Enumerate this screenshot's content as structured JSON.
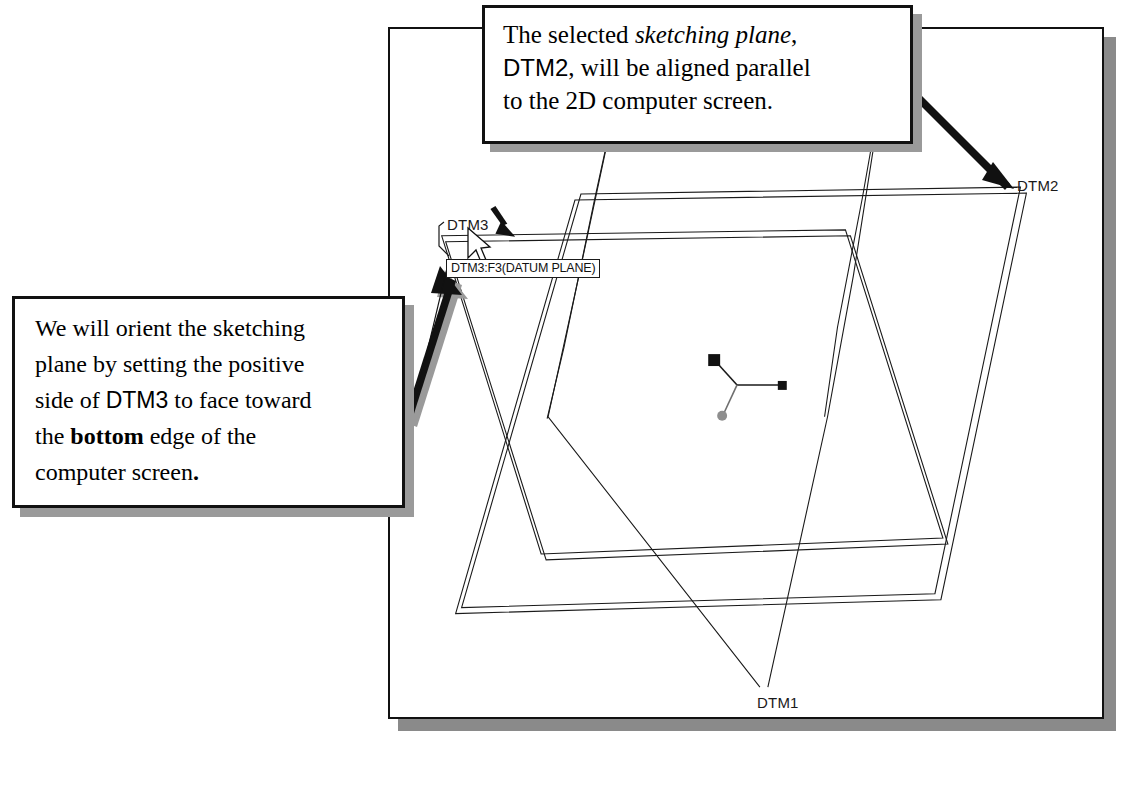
{
  "document": {
    "type": "cad-tutorial-figure",
    "background_color": "#ffffff"
  },
  "cad_window": {
    "name": "pro-engineer-graphics-window",
    "border_color": "#111111",
    "background_color": "#ffffff",
    "shadow_color": "#8a8a8a"
  },
  "model": {
    "description": "Three default datum planes shown in a 3D trimetric view with a coordinate system triad at the origin.",
    "datum_planes": [
      {
        "id": "dtm2",
        "label": "DTM2",
        "role": "sketching plane",
        "label_position": {
          "x": 1017,
          "y": 177
        }
      },
      {
        "id": "dtm3",
        "label": "DTM3",
        "role": "reference / orientation plane",
        "label_position": {
          "x": 447,
          "y": 216
        }
      },
      {
        "id": "dtm1",
        "label": "DTM1",
        "role": "datum plane",
        "label_position": {
          "x": 757,
          "y": 694
        }
      }
    ],
    "coordinate_system": {
      "name": "csys-triad",
      "axes": 3,
      "origin": {
        "x": 737,
        "y": 383
      }
    },
    "direction_arrow": {
      "name": "positive-side-arrow",
      "meaning": "positive side of DTM3",
      "points": "down-right"
    }
  },
  "tooltip": {
    "text": "DTM3:F3(DATUM PLANE)",
    "border_color": "#1a1a1a",
    "background_color": "#ffffff"
  },
  "cursor": {
    "name": "mouse-pointer",
    "position": {
      "x": 472,
      "y": 232
    }
  },
  "callouts": [
    {
      "id": "callout-top",
      "target": "DTM2",
      "lines": [
        {
          "segments": [
            {
              "text": "The selected ",
              "style": "normal"
            },
            {
              "text": "sketching plane",
              "style": "italic"
            },
            {
              "text": ",",
              "style": "normal"
            }
          ]
        },
        {
          "segments": [
            {
              "text": "DTM2",
              "style": "sans"
            },
            {
              "text": ", will be aligned parallel",
              "style": "normal"
            }
          ]
        },
        {
          "segments": [
            {
              "text": "to the 2D computer screen.",
              "style": "normal"
            }
          ]
        }
      ]
    },
    {
      "id": "callout-left",
      "target": "DTM3",
      "lines": [
        {
          "segments": [
            {
              "text": "We will orient the sketching",
              "style": "normal"
            }
          ]
        },
        {
          "segments": [
            {
              "text": "plane by setting the positive",
              "style": "normal"
            }
          ]
        },
        {
          "segments": [
            {
              "text": "side of ",
              "style": "normal"
            },
            {
              "text": "DTM3",
              "style": "sans"
            },
            {
              "text": " to face toward",
              "style": "normal"
            }
          ]
        },
        {
          "segments": [
            {
              "text": "the ",
              "style": "normal"
            },
            {
              "text": "bottom",
              "style": "bold"
            },
            {
              "text": " edge of the",
              "style": "normal"
            }
          ]
        },
        {
          "segments": [
            {
              "text": "computer screen",
              "style": "normal"
            },
            {
              "text": ".",
              "style": "bold"
            }
          ]
        }
      ]
    }
  ],
  "callout_text": {
    "top": {
      "line1_a": "The selected ",
      "line1_em": "sketching plane",
      "line1_b": ",",
      "line2_a": "DTM2",
      "line2_b": ", will be aligned parallel",
      "line3": "to the 2D computer screen."
    },
    "left": {
      "line1": "We will orient the sketching",
      "line2": "plane by setting the positive",
      "line3_a": "side of ",
      "line3_b": "DTM3",
      "line3_c": " to face toward",
      "line4_a": "the ",
      "line4_b": "bottom",
      "line4_c": " edge of the",
      "line5_a": "computer screen",
      "line5_b": "."
    }
  },
  "labels": {
    "dtm1": "DTM1",
    "dtm2": "DTM2",
    "dtm3": "DTM3"
  },
  "colors": {
    "line": "#1a1a1a",
    "callout_border": "#111111",
    "callout_shadow": "#9a9a9a",
    "window_shadow": "#8a8a8a",
    "tooltip_border": "#1a1a1a",
    "axis_gray": "#6e6e6e"
  }
}
